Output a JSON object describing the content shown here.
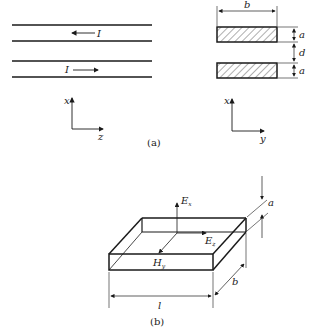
{
  "figure_a": {
    "caption": "(a)",
    "current_label_top": "I",
    "current_label_bottom": "I",
    "axes_left": {
      "vertical": "x",
      "horizontal": "z"
    },
    "axes_right": {
      "vertical": "x",
      "horizontal": "y"
    },
    "dim_width": "b",
    "dim_thickness_top": "a",
    "dim_gap": "d",
    "dim_thickness_bottom": "a"
  },
  "figure_b": {
    "caption": "(b)",
    "field_Ex": "E",
    "field_Ex_sub": "x",
    "field_Ez": "E",
    "field_Ez_sub": "z",
    "field_Hy": "H",
    "field_Hy_sub": "y",
    "dim_length": "l",
    "dim_width": "b",
    "dim_height": "a"
  },
  "colors": {
    "line": "#1a1a1a",
    "background": "#ffffff"
  }
}
